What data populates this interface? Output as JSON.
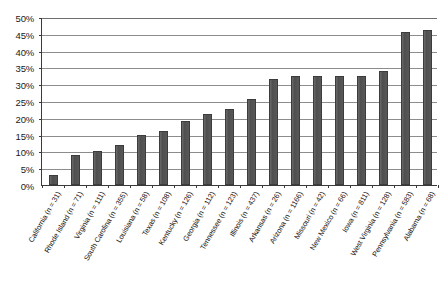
{
  "chart_data": {
    "type": "bar",
    "title": "",
    "xlabel": "",
    "ylabel": "",
    "ylim": [
      0,
      50
    ],
    "ytick_labels": [
      "50%",
      "45%",
      "40%",
      "35%",
      "30%",
      "25%",
      "20%",
      "15%",
      "10%",
      "5%",
      "0%"
    ],
    "ytick_values": [
      50,
      45,
      40,
      35,
      30,
      25,
      20,
      15,
      10,
      5,
      0
    ],
    "grid": true,
    "legend": "none",
    "bar_color": "#555555",
    "categories": [
      "California (n = 31)",
      "Rhode Island (n = 71)",
      "Virginia (n = 111)",
      "South Carolina (n = 355)",
      "Louisiana (n = 58)",
      "Texas (n = 108)",
      "Kentucky (n = 126)",
      "Georgia (n = 112)",
      "Tennessee (n = 123)",
      "Illinois (n = 437)",
      "Arkansas (n = 26)",
      "Arizona (n = 1166)",
      "Missouri (n = 42)",
      "New Mexico (n = 66)",
      "Iowa (n = 811)",
      "West Virginia (n = 128)",
      "Pennsylvania (n = 583)",
      "Alabama (n = 68)"
    ],
    "values": [
      3,
      9,
      10,
      12,
      15,
      16,
      19,
      21,
      22.5,
      25.5,
      31.5,
      32.5,
      32.5,
      32.5,
      32.5,
      34,
      45.5,
      46
    ]
  }
}
